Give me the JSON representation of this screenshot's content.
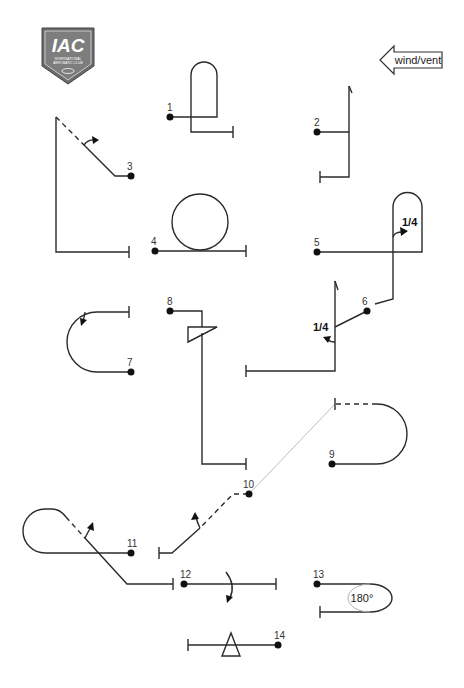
{
  "logo": {
    "text": "IAC",
    "subtitle": "INTERNATIONAL AEROBATIC CLUB",
    "mark": "™",
    "colors": {
      "shield": "#6b6b6b",
      "text": "#ffffff"
    }
  },
  "wind": {
    "label": "wind/vent",
    "direction": "left"
  },
  "figures": [
    {
      "number": "1",
      "type": "half-loop-return"
    },
    {
      "number": "2",
      "type": "vertical-line"
    },
    {
      "number": "3",
      "type": "45-line-roll"
    },
    {
      "number": "4",
      "type": "loop"
    },
    {
      "number": "5",
      "type": "humpty-quarter-roll",
      "roll_label": "1/4"
    },
    {
      "number": "6",
      "type": "vertical-quarter-roll",
      "roll_label": "1/4"
    },
    {
      "number": "7",
      "type": "half-loop"
    },
    {
      "number": "8",
      "type": "snap-vertical"
    },
    {
      "number": "9",
      "type": "half-loop"
    },
    {
      "number": "10",
      "type": "45-line-roll"
    },
    {
      "number": "11",
      "type": "reverse-cuban"
    },
    {
      "number": "12",
      "type": "roll"
    },
    {
      "number": "13",
      "type": "turn",
      "turn_label": "180°"
    },
    {
      "number": "14",
      "type": "snap-roll"
    }
  ]
}
